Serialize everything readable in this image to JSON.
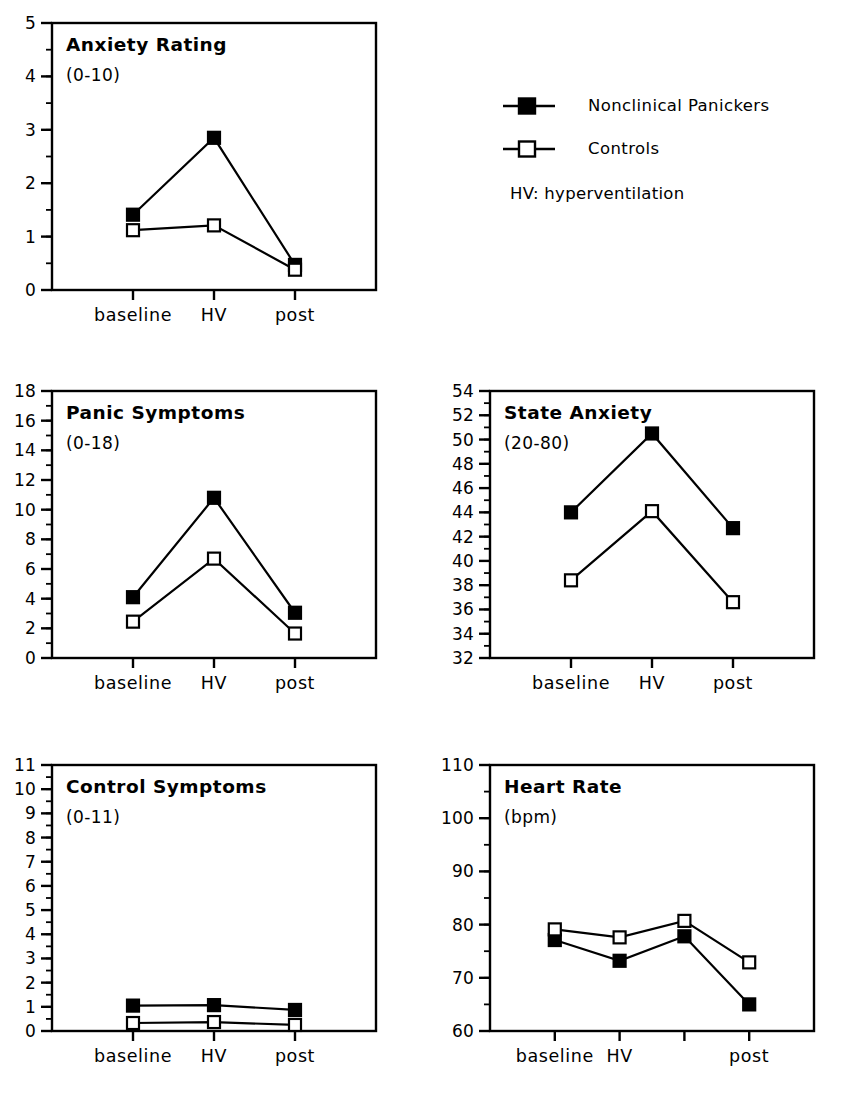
{
  "legend": {
    "entries": [
      {
        "label": "Nonclinical Panickers",
        "marker": "filled-square-marker"
      },
      {
        "label": "Controls",
        "marker": "open-square-marker"
      }
    ],
    "note": "HV: hyperventilation"
  },
  "colors": {
    "line": "#000000",
    "filled_marker": "#000000",
    "open_marker_fill": "#ffffff",
    "axis": "#000000",
    "background": "#ffffff"
  },
  "chart_data": [
    {
      "id": "anxiety-rating",
      "type": "line",
      "title": "Anxiety Rating",
      "subtitle": "(0-10)",
      "xlabel": "",
      "ylabel": "",
      "categories": [
        "baseline",
        "HV",
        "post"
      ],
      "x_tick_labels": [
        "baseline",
        "HV",
        "post"
      ],
      "ylim": [
        0,
        5
      ],
      "ytick_step": 1,
      "yminor_step": 0.5,
      "ytick_labels": [
        "0",
        "1",
        "2",
        "3",
        "4",
        "5"
      ],
      "grid": false,
      "legend_position": "external-top-right",
      "series": [
        {
          "name": "Nonclinical Panickers",
          "marker": "filled",
          "values": [
            1.41,
            2.85,
            0.47
          ]
        },
        {
          "name": "Controls",
          "marker": "open",
          "values": [
            1.12,
            1.21,
            0.38
          ]
        }
      ]
    },
    {
      "id": "panic-symptoms",
      "type": "line",
      "title": "Panic Symptoms",
      "subtitle": "(0-18)",
      "xlabel": "",
      "ylabel": "",
      "categories": [
        "baseline",
        "HV",
        "post"
      ],
      "x_tick_labels": [
        "baseline",
        "HV",
        "post"
      ],
      "ylim": [
        0,
        18
      ],
      "ytick_step": 2,
      "yminor_step": 1,
      "ytick_labels": [
        "0",
        "2",
        "4",
        "6",
        "8",
        "10",
        "12",
        "14",
        "16",
        "18"
      ],
      "grid": false,
      "legend_position": "none",
      "series": [
        {
          "name": "Nonclinical Panickers",
          "marker": "filled",
          "values": [
            4.1,
            10.8,
            3.05
          ]
        },
        {
          "name": "Controls",
          "marker": "open",
          "values": [
            2.45,
            6.7,
            1.65
          ]
        }
      ]
    },
    {
      "id": "state-anxiety",
      "type": "line",
      "title": "State Anxiety",
      "subtitle": "(20-80)",
      "xlabel": "",
      "ylabel": "",
      "categories": [
        "baseline",
        "HV",
        "post"
      ],
      "x_tick_labels": [
        "baseline",
        "HV",
        "post"
      ],
      "ylim": [
        32,
        54
      ],
      "ytick_step": 2,
      "yminor_step": 1,
      "ytick_labels": [
        "32",
        "34",
        "36",
        "38",
        "40",
        "42",
        "44",
        "46",
        "48",
        "50",
        "52",
        "54"
      ],
      "grid": false,
      "legend_position": "none",
      "series": [
        {
          "name": "Nonclinical Panickers",
          "marker": "filled",
          "values": [
            44.0,
            50.5,
            42.7
          ]
        },
        {
          "name": "Controls",
          "marker": "open",
          "values": [
            38.4,
            44.1,
            36.6
          ]
        }
      ]
    },
    {
      "id": "control-symptoms",
      "type": "line",
      "title": "Control Symptoms",
      "subtitle": "(0-11)",
      "xlabel": "",
      "ylabel": "",
      "categories": [
        "baseline",
        "HV",
        "post"
      ],
      "x_tick_labels": [
        "baseline",
        "HV",
        "post"
      ],
      "ylim": [
        0,
        11
      ],
      "ytick_step": 1,
      "yminor_step": 0.5,
      "ytick_labels": [
        "0",
        "1",
        "2",
        "3",
        "4",
        "5",
        "6",
        "7",
        "8",
        "9",
        "10",
        "11"
      ],
      "grid": false,
      "legend_position": "none",
      "series": [
        {
          "name": "Nonclinical Panickers",
          "marker": "filled",
          "values": [
            1.05,
            1.07,
            0.87
          ]
        },
        {
          "name": "Controls",
          "marker": "open",
          "values": [
            0.33,
            0.37,
            0.25
          ]
        }
      ]
    },
    {
      "id": "heart-rate",
      "type": "line",
      "title": "Heart Rate",
      "subtitle": "(bpm)",
      "xlabel": "",
      "ylabel": "",
      "categories": [
        "baseline",
        "HV",
        "",
        "post"
      ],
      "x_tick_labels": [
        "baseline",
        "HV",
        "",
        "post"
      ],
      "ylim": [
        60,
        110
      ],
      "ytick_step": 10,
      "yminor_step": 5,
      "ytick_labels": [
        "60",
        "70",
        "80",
        "90",
        "100",
        "110"
      ],
      "grid": false,
      "legend_position": "none",
      "series": [
        {
          "name": "Nonclinical Panickers",
          "marker": "filled",
          "values": [
            77.1,
            73.2,
            77.8,
            65.0
          ]
        },
        {
          "name": "Controls",
          "marker": "open",
          "values": [
            79.1,
            77.6,
            80.7,
            72.9
          ]
        }
      ]
    }
  ],
  "panel_layout": [
    {
      "id": "anxiety-rating",
      "left": 0,
      "top": 0,
      "width": 420,
      "height": 372
    },
    {
      "id": "panic-symptoms",
      "left": 0,
      "top": 368,
      "width": 420,
      "height": 372
    },
    {
      "id": "state-anxiety",
      "left": 438,
      "top": 368,
      "width": 420,
      "height": 372
    },
    {
      "id": "control-symptoms",
      "left": 0,
      "top": 742,
      "width": 420,
      "height": 359
    },
    {
      "id": "heart-rate",
      "left": 438,
      "top": 742,
      "width": 420,
      "height": 359
    }
  ]
}
